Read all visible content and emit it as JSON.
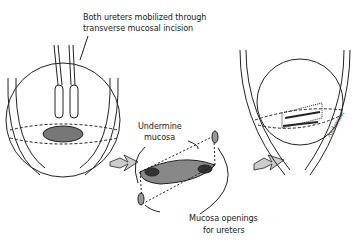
{
  "labels": {
    "top_line1": "Both ureters mobilized through",
    "top_line2": "transverse mucosal incision",
    "undermine_line1": "Undermine",
    "undermine_line2": "mucosa",
    "openings_line1": "Mucosa openings",
    "openings_line2": "for ureters",
    "signature": "Anderson"
  },
  "colors": {
    "line": "#222222",
    "arrow_fill": "#cccccc"
  }
}
